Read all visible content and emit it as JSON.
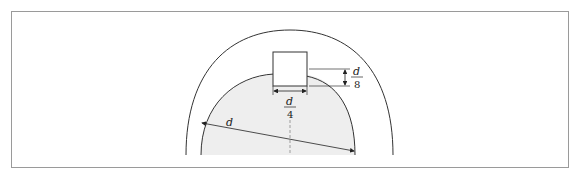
{
  "diagram": {
    "labels": {
      "diameter": "d",
      "key_width_num": "d",
      "key_width_den": "4",
      "key_depth_num": "d",
      "key_depth_den": "8"
    },
    "colors": {
      "frame": "#9a9a9a",
      "line": "#333333",
      "shaft_fill": "#eeeeee",
      "background": "#ffffff"
    }
  }
}
